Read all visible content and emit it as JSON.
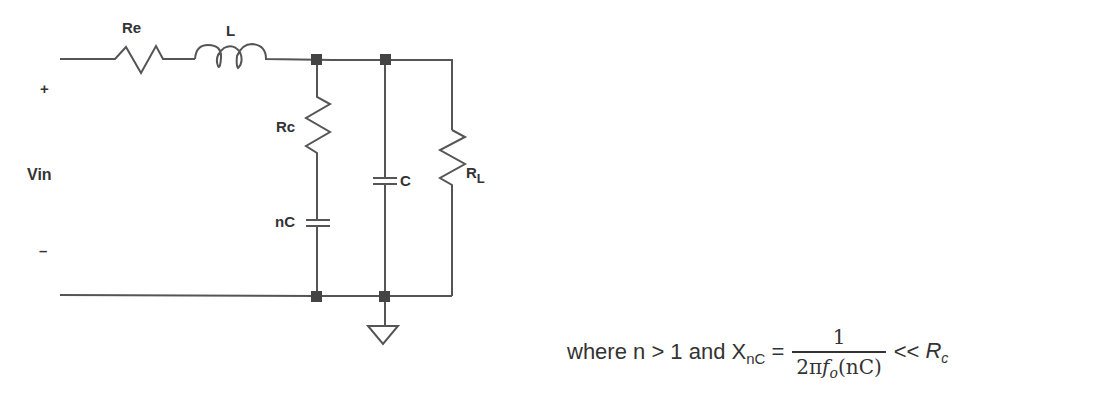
{
  "diagram": {
    "type": "RC snubber / damped LC filter schematic",
    "input": {
      "label": "Vin",
      "plus": "+",
      "minus": "–"
    },
    "components": [
      {
        "id": "Re",
        "label": "Re",
        "type": "resistor",
        "placement": "series"
      },
      {
        "id": "L",
        "label": "L",
        "type": "inductor",
        "placement": "series"
      },
      {
        "id": "Rc",
        "label": "Rc",
        "type": "resistor",
        "placement": "shunt branch 1 (top)"
      },
      {
        "id": "nC",
        "label": "nC",
        "type": "capacitor",
        "placement": "shunt branch 1 (bottom)"
      },
      {
        "id": "C",
        "label": "C",
        "type": "capacitor",
        "placement": "shunt branch 2"
      },
      {
        "id": "RL",
        "label": "R",
        "label_sub": "L",
        "type": "resistor",
        "placement": "load"
      }
    ],
    "ground": "ground-symbol"
  },
  "formula": {
    "prefix": "where n  > 1 and X",
    "x_sub": "nC",
    "equals": "=",
    "numerator": "1",
    "denominator_a": "2π",
    "denominator_f": "f",
    "denominator_f_sub": "o",
    "denominator_b": "(nC)",
    "comparator": "<<",
    "rhs": "R",
    "rhs_sub": "c"
  },
  "colors": {
    "wire": "#555555",
    "node": "#444444",
    "text": "#333333"
  }
}
